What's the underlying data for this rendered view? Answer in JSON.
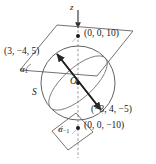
{
  "figure": {
    "background_color": "#ffffff",
    "stroke_color": "#3a3a3a",
    "text_color": "#1a1a1a"
  },
  "axis": {
    "name": "z",
    "label": "z"
  },
  "sphere": {
    "label": "S",
    "radius_units": 10,
    "center": "O"
  },
  "origin": {
    "label": "O"
  },
  "points": {
    "top_pole": {
      "label": "(0, 0, 10)",
      "coords": [
        0,
        0,
        10
      ]
    },
    "bottom_pole": {
      "label": "(0, 0, −10)",
      "coords": [
        0,
        0,
        -10
      ]
    },
    "upper": {
      "label": "(3, −4, 5)",
      "coords": [
        3,
        -4,
        5
      ]
    },
    "lower": {
      "label": "(−3, 4, −5)",
      "coords": [
        -3,
        4,
        -5
      ]
    }
  },
  "planes": {
    "upper": {
      "label": "α",
      "subscript": "1",
      "full_label": "α₁"
    },
    "lower": {
      "label": "α",
      "subscript": "−1",
      "full_label": "α₋₁"
    }
  }
}
